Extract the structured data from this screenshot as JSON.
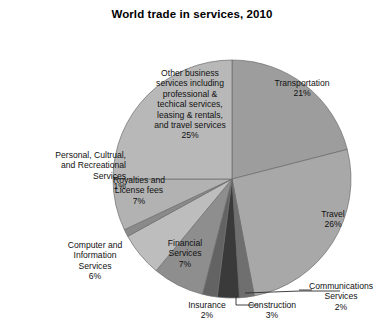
{
  "chart_data": {
    "type": "pie",
    "title": "World trade in services, 2010",
    "subtitle": "",
    "xlabel": "",
    "ylabel": "",
    "legend_position": "none",
    "grid": false,
    "start_angle_deg": 0,
    "direction": "clockwise",
    "units": "percent",
    "categories": [
      "Transportation",
      "Travel",
      "Communications Services",
      "Construction",
      "Insurance",
      "Financial Services",
      "Computer and Information Services",
      "Personal, Cultrual, and Recreational Services",
      "Royalties and License fees",
      "Other business services including professional & techical services, leasing & rentals, and travel services"
    ],
    "values": [
      21,
      26,
      2,
      3,
      2,
      7,
      6,
      1,
      7,
      25
    ],
    "slices": [
      {
        "id": "transportation",
        "value": 21,
        "pct_label": "21%",
        "color": "#9d9d9d"
      },
      {
        "id": "travel",
        "value": 26,
        "pct_label": "26%",
        "color": "#a8a8a8"
      },
      {
        "id": "communications",
        "value": 2,
        "pct_label": "2%",
        "color": "#6f6f6f"
      },
      {
        "id": "construction",
        "value": 3,
        "pct_label": "3%",
        "color": "#3a3a3a"
      },
      {
        "id": "insurance",
        "value": 2,
        "pct_label": "2%",
        "color": "#636363"
      },
      {
        "id": "financial",
        "value": 7,
        "pct_label": "7%",
        "color": "#8e8e8e"
      },
      {
        "id": "computer-information",
        "value": 6,
        "pct_label": "6%",
        "color": "#bdbdbd"
      },
      {
        "id": "personal-recreational",
        "value": 1,
        "pct_label": "1%",
        "color": "#8a8a8a"
      },
      {
        "id": "royalties",
        "value": 7,
        "pct_label": "7%",
        "color": "#b2b2b2"
      },
      {
        "id": "other-business",
        "value": 25,
        "pct_label": "25%",
        "color": "#b8b8b8"
      }
    ]
  },
  "labels": {
    "other_business": {
      "line1": "Other business",
      "line2": "services including",
      "line3": "professional &",
      "line4": "techical services,",
      "line5": "leasing & rentals,",
      "line6": "and travel services",
      "pct": "25%"
    },
    "transportation": {
      "line1": "Transportation",
      "pct": "21%"
    },
    "travel": {
      "line1": "Travel",
      "pct": "26%"
    },
    "communications": {
      "line1": "Communications",
      "line2": "Services",
      "pct": "2%"
    },
    "construction": {
      "line1": "Construction",
      "pct": "3%"
    },
    "insurance": {
      "line1": "Insurance",
      "pct": "2%"
    },
    "financial": {
      "line1": "Financial",
      "line2": "Services",
      "pct": "7%"
    },
    "computer": {
      "line1": "Computer and",
      "line2": "Information",
      "line3": "Services",
      "pct": "6%"
    },
    "personal": {
      "line1": "Personal, Cultrual,",
      "line2": "and Recreational",
      "line3": "Services",
      "pct": "1%"
    },
    "royalties": {
      "line1": "Royalties and",
      "line2": "License fees",
      "pct": "7%"
    }
  },
  "colors": {
    "background": "#ffffff",
    "text": "#111111",
    "outline": "#6b6b6b",
    "leader_line": "#3b3b3b"
  }
}
